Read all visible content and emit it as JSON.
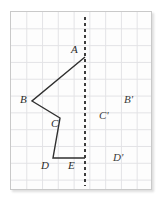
{
  "figure": {
    "name": "reflection-over-vertical-line-figure",
    "background_color": "#ffffff",
    "panel": {
      "fill": "#fdfdfd",
      "border_color": "#c9c9c9",
      "x": 10,
      "y": 11,
      "width": 142,
      "height": 179
    },
    "grid": {
      "line_color": "#e3e3e6",
      "cell_width": 16,
      "cell_height": 17,
      "columns": 9,
      "rows": 11,
      "visible": true
    },
    "mirror_line": {
      "label": "line-of-reflection",
      "orientation": "vertical",
      "style": "dotted",
      "color": "#3c3c3c",
      "x": 85,
      "y_top": 17,
      "y_bottom": 186,
      "width": 2
    },
    "shape": {
      "name": "polyline-ABCDE",
      "stroke_color": "#2f2f2f",
      "stroke_width": 1.4,
      "fill": "none",
      "points": [
        {
          "label": "A",
          "x": 85,
          "y": 57
        },
        {
          "label": "B",
          "x": 32,
          "y": 101
        },
        {
          "label": "C",
          "x": 60,
          "y": 118
        },
        {
          "label": "D",
          "x": 53,
          "y": 158
        },
        {
          "label": "E",
          "x": 85,
          "y": 158
        }
      ]
    },
    "labels": [
      {
        "id": "A",
        "text": "A",
        "x": 71,
        "y": 44,
        "primed": false
      },
      {
        "id": "B",
        "text": "B",
        "x": 20,
        "y": 94,
        "primed": false
      },
      {
        "id": "C",
        "text": "C",
        "x": 51,
        "y": 118,
        "primed": false
      },
      {
        "id": "D",
        "text": "D",
        "x": 41,
        "y": 160,
        "primed": false
      },
      {
        "id": "E",
        "text": "E",
        "x": 68,
        "y": 160,
        "primed": false
      },
      {
        "id": "Bp",
        "text": "B'",
        "x": 124,
        "y": 94,
        "primed": true
      },
      {
        "id": "Cp",
        "text": "C'",
        "x": 99,
        "y": 110,
        "primed": true
      },
      {
        "id": "Dp",
        "text": "D'",
        "x": 113,
        "y": 152,
        "primed": true
      }
    ]
  }
}
